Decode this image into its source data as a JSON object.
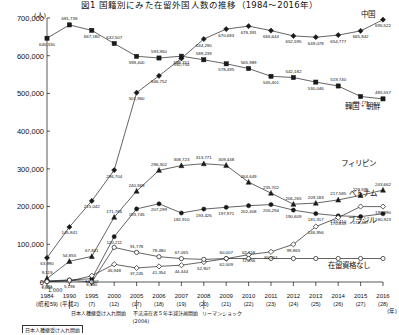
{
  "header": {
    "title": "図1 国籍別にみた在留外国人数の推移（1984〜2016年）",
    "unit_label": "(人)"
  },
  "axes": {
    "y_ticks": [
      "0",
      "100,000",
      "200,000",
      "300,000",
      "400,000",
      "500,000",
      "600,000",
      "700,000"
    ],
    "y_min": 0,
    "y_max": 700000,
    "x_years": [
      "1984",
      "1990",
      "1995",
      "2000",
      "2005",
      "2006",
      "2007",
      "2008",
      "2009",
      "2010",
      "2011",
      "2012",
      "2013",
      "2014",
      "2015",
      "2016"
    ],
    "x_eras": [
      "(昭和59)",
      "(平成2)",
      "(7)",
      "(12)",
      "(17)",
      "(18)",
      "(19)",
      "(20)",
      "(21)",
      "(22)",
      "(23)",
      "(24)",
      "(25)",
      "(26)",
      "(27)",
      "(28)"
    ],
    "x_axis_unit": "(年)"
  },
  "annotations": {
    "below_zero": "1,000",
    "note_1990": "日本人種継受け入れ開始",
    "note_2004": "不法滞在者５年半減計画開始\n(2004)",
    "note_2008": "リーマンショック",
    "source": "日本人種継受け入れ開始"
  },
  "footnote_box": "日本人種継受け入れ開始",
  "chart_data": {
    "type": "line",
    "title": "図1 国籍別にみた在留外国人数の推移（1984〜2016年）",
    "xlabel": "(年)",
    "ylabel": "(人)",
    "ylim": [
      0,
      700000
    ],
    "grid": false,
    "legend_position": "right-inline",
    "categories": [
      "1984",
      "1990",
      "1995",
      "2000",
      "2005",
      "2006",
      "2007",
      "2008",
      "2009",
      "2010",
      "2011",
      "2012",
      "2013",
      "2014",
      "2015",
      "2016"
    ],
    "series": [
      {
        "name": "韓国・朝鮮",
        "marker": "square",
        "values": [
          646330,
          681738,
          667180,
          632507,
          598400,
          593960,
          598752,
          589239,
          578495,
          565989,
          545401,
          542182,
          530046,
          519740,
          491771,
          485557
        ],
        "labels": [
          "646,330",
          "681,738",
          "667,180",
          "632,507",
          "598,400",
          "593,960",
          "598,752",
          "589,239",
          "578,495",
          "565,989",
          "545,401",
          "542,182",
          "530,046",
          "519,740",
          "491,771",
          "485,557"
        ]
      },
      {
        "name": "中国",
        "marker": "diamond",
        "values": [
          63990,
          145841,
          215042,
          296704,
          501960,
          546752,
          592754,
          644290,
          670683,
          678391,
          666644,
          652595,
          649078,
          654777,
          665842,
          695522
        ],
        "labels": [
          "63,990",
          "145,841",
          "215,042",
          "296,704",
          "501,960",
          "546,752",
          "592,754",
          "644,290",
          "670,683",
          "678,391",
          "666,644",
          "652,595",
          "649,078",
          "654,777",
          "665,842",
          "695,522"
        ]
      },
      {
        "name": "フィリピン",
        "marker": "triangle",
        "values": [
          9119,
          54855,
          67841,
          171766,
          240969,
          296302,
          308723,
          313771,
          309448,
          264649,
          235702,
          206265,
          209183,
          217585,
          229595,
          243662
        ],
        "labels": [
          "9,119",
          "54,855",
          "67,841",
          "171,766",
          "240,969",
          "296,302",
          "308,723",
          "313,771",
          "309,448",
          "264,649",
          "235,702",
          "206,265",
          "209,183",
          "217,585",
          "229,595",
          "243,662"
        ]
      },
      {
        "name": "ブラジル",
        "marker": "circle",
        "values": [
          2981,
          5196,
          8880,
          120211,
          193745,
          207299,
          182910,
          193426,
          197971,
          202408,
          205294,
          190609,
          181317,
          175410,
          173437,
          180923
        ],
        "labels": [
          "2,981",
          "5,196",
          "8,880",
          "120,211",
          "193,745",
          "207,299",
          "182,910",
          "193,426",
          "197,971",
          "202,408",
          "205,294",
          "190,609",
          "181,317",
          "175,410",
          "173,437",
          "180,923"
        ]
      },
      {
        "name": "ベトナム",
        "marker": "diamond-open",
        "values": [
          1000,
          2000,
          16602,
          46948,
          37245,
          41354,
          44444,
          52907,
          62009,
          72256,
          80001,
          99865,
          146956,
          170839,
          199990,
          199990
        ],
        "labels": [
          "1,000",
          "",
          "16,602",
          "46,948",
          "37,245",
          "41,354",
          "44,444",
          "52,907",
          "62,009",
          "72,256",
          "80,001",
          "99,865",
          "146,956",
          "170,839",
          "",
          "199,990"
        ]
      },
      {
        "name": "在留資格なし",
        "marker": "circle-open",
        "values": [
          1000,
          5000,
          27,
          91778,
          78480,
          67065,
          62009,
          60007,
          62318,
          62318,
          62318,
          62318,
          62318,
          62318,
          62318,
          62318
        ],
        "labels": [
          "",
          "",
          "",
          "",
          "91,778",
          "78,480",
          "67,065",
          "",
          "60,007",
          "62,318",
          "",
          "",
          "",
          "",
          "",
          ""
        ]
      }
    ],
    "series_labels_right": [
      "中国",
      "韓国・朝鮮",
      "フィリピン",
      "ベトナム",
      "ブラジル",
      "在留資格なし"
    ]
  }
}
